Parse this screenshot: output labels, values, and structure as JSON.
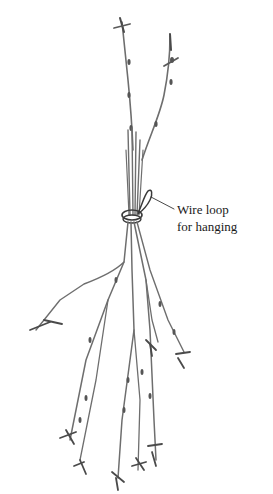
{
  "illustration": {
    "subject": "Bundle of dried herb stems tied with wire loop",
    "style": "pencil sketch",
    "stroke_color": "#6e6e6e",
    "dark_stroke_color": "#3a3a3a",
    "background": "#ffffff"
  },
  "callout": {
    "line1": "Wire loop",
    "line2": "for hanging"
  }
}
